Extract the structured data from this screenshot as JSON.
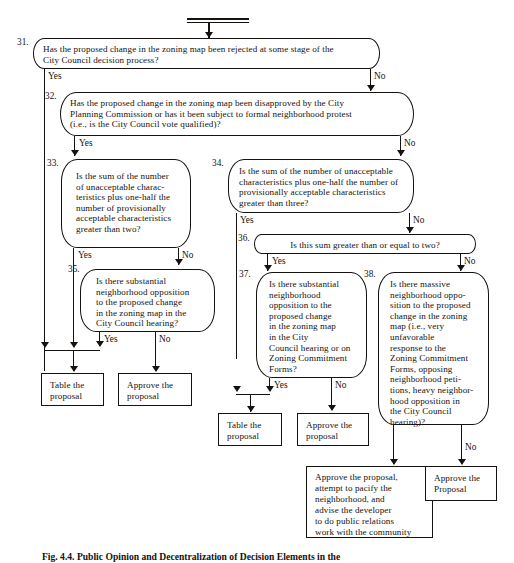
{
  "figure": {
    "title_caption": "Fig. 4.4. Public Opinion and Decentralization of Decision Elements in the",
    "start_label": ""
  },
  "nodes": [
    {
      "id": "31.",
      "key": "n31",
      "text": "Has the proposed change in the zoning map been rejected at some stage of the\nCity Council decision process?"
    },
    {
      "id": "32.",
      "key": "n32",
      "text": "Has the proposed change in the zoning map been disapproved by the City\nPlanning Commission or  has it been subject to formal neighborhood protest\n(i.e., is the City Council vote qualified)?"
    },
    {
      "id": "33.",
      "key": "n33",
      "text": "Is the sum of the number\nof unacceptable charac-\nteristics plus one-half the\nnumber of provisionally\nacceptable characteristics\ngreater than two?"
    },
    {
      "id": "34.",
      "key": "n34",
      "text": "Is the sum of the number of unacceptable\ncharacteristics plus one-half the number of\nprovisionally acceptable characteristics\ngreater than three?"
    },
    {
      "id": "35.",
      "key": "n35",
      "text": "Is there substantial\nneighborhood opposition\nto the proposed change\nin the zoning map in the\nCity Council hearing?"
    },
    {
      "id": "36.",
      "key": "n36",
      "text": "Is this sum greater than or equal to two?"
    },
    {
      "id": "37.",
      "key": "n37",
      "text": "Is there substantial\nneighborhood\nopposition to the\nproposed change\nin the zoning map\nin the City\nCouncil hearing or on\nZoning Commitment\nForms?"
    },
    {
      "id": "38.",
      "key": "n38",
      "text": "Is there massive\nneighborhood oppo-\nsition to the proposed\nchange in the zoning\nmap (i.e., very\nunfavorable\nresponse to the\nZoning Commitment\nForms, opposing\nneighborhood peti-\ntions, heavy neighbor-\nhood opposition in\nthe City Council\nhearing)?"
    }
  ],
  "terminals": {
    "t_table_left": "Table the\nproposal",
    "t_approve_left": "Approve the\nproposal",
    "t_table_mid": "Table the\nproposal",
    "t_approve_mid": "Approve the\nproposal",
    "t_approve_pacify": "Approve the proposal,\nattempt to pacify the\nneighborhood, and\nadvise the developer\nto do public relations\nwork with the community",
    "t_approve_right": "Approve the\nProposal"
  },
  "edge_labels": {
    "n31_yes": "Yes",
    "n31_no": "No",
    "n32_yes": "Yes",
    "n32_no": "No",
    "n33_yes": "Yes",
    "n33_no": "No",
    "n34_yes": "Yes",
    "n34_no": "No",
    "n35_yes": "Yes",
    "n35_no": "No",
    "n36_yes": "Yes",
    "n36_no": "No",
    "n37_yes": "Yes",
    "n37_no": "No",
    "n38_no": "No"
  },
  "colors": {
    "ink": "#15120f",
    "paper": "#ffffff"
  }
}
